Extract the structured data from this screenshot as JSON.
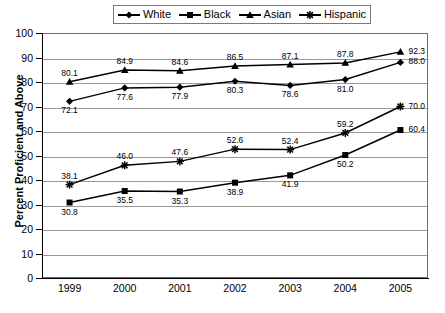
{
  "legend": {
    "entries": [
      {
        "label": "White",
        "marker": "diamond-marker-icon"
      },
      {
        "label": "Black",
        "marker": "square-marker-icon"
      },
      {
        "label": "Asian",
        "marker": "triangle-marker-icon"
      },
      {
        "label": "Hispanic",
        "marker": "asterisk-marker-icon"
      }
    ]
  },
  "axes": {
    "y_title": "Percent Proficient and Above",
    "y_ticks": [
      "100",
      "90",
      "80",
      "70",
      "60",
      "50",
      "40",
      "30",
      "20",
      "10",
      "0"
    ],
    "x_ticks": [
      "1999",
      "2000",
      "2001",
      "2002",
      "2003",
      "2004",
      "2005"
    ]
  },
  "chart_data": {
    "type": "line",
    "title": "",
    "xlabel": "",
    "ylabel": "Percent Proficient and Above",
    "ylim": [
      0,
      100
    ],
    "ytick_step": 10,
    "grid": true,
    "legend_position": "top",
    "categories": [
      "1999",
      "2000",
      "2001",
      "2002",
      "2003",
      "2004",
      "2005"
    ],
    "series": [
      {
        "name": "White",
        "marker": "diamond",
        "color": "#000000",
        "values": [
          72.1,
          77.6,
          77.9,
          80.3,
          78.6,
          81.0,
          88.0
        ],
        "label_positions": [
          "below",
          "below",
          "below",
          "below",
          "below",
          "below",
          "right"
        ]
      },
      {
        "name": "Black",
        "marker": "square",
        "color": "#000000",
        "values": [
          30.8,
          35.5,
          35.3,
          38.9,
          41.9,
          50.2,
          60.4
        ],
        "label_positions": [
          "below",
          "below",
          "below",
          "below",
          "below",
          "below",
          "right"
        ]
      },
      {
        "name": "Asian",
        "marker": "triangle",
        "color": "#000000",
        "values": [
          80.1,
          84.9,
          84.6,
          86.5,
          87.1,
          87.8,
          92.3
        ],
        "label_positions": [
          "above",
          "above",
          "above",
          "above",
          "above",
          "above",
          "right"
        ]
      },
      {
        "name": "Hispanic",
        "marker": "asterisk",
        "color": "#000000",
        "values": [
          38.1,
          46.0,
          47.6,
          52.6,
          52.4,
          59.2,
          70.0
        ],
        "label_positions": [
          "above",
          "above",
          "above",
          "above",
          "above",
          "above",
          "right"
        ]
      }
    ]
  }
}
